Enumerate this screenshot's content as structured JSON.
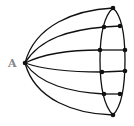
{
  "diagram": {
    "type": "graph",
    "labels": {
      "A": "A"
    },
    "colors": {
      "stroke": "#111111",
      "label": "#888888",
      "background": "#ffffff"
    },
    "nodes": {
      "A": [
        25,
        63
      ],
      "T": [
        113,
        8
      ],
      "L1": [
        104,
        27
      ],
      "R1": [
        120,
        26
      ],
      "L2": [
        100,
        50
      ],
      "R2": [
        125,
        50
      ],
      "L3": [
        102,
        72
      ],
      "R3": [
        125,
        71
      ],
      "L4": [
        104,
        94
      ],
      "R4": [
        120,
        94
      ],
      "B": [
        113,
        115
      ]
    },
    "spokes": [
      "T",
      "L1",
      "L2",
      "L3",
      "L4",
      "B"
    ],
    "rungs": [
      [
        "L1",
        "R1"
      ],
      [
        "L2",
        "R2"
      ],
      [
        "L3",
        "R3"
      ],
      [
        "L4",
        "R4"
      ]
    ]
  }
}
